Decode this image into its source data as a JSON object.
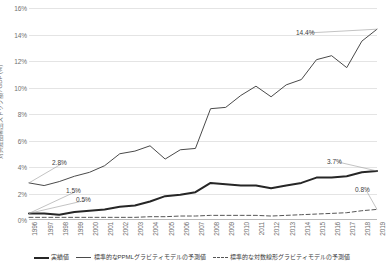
{
  "chart_data": {
    "type": "line",
    "title": "",
    "xlabel": "",
    "ylabel": "対共産圏輸出ストック額 / GDP (%)",
    "ylim": [
      0,
      16
    ],
    "ytick_labels": [
      "0%",
      "2%",
      "4%",
      "6%",
      "8%",
      "10%",
      "12%",
      "14%",
      "16%"
    ],
    "ytick_values": [
      0,
      2,
      4,
      6,
      8,
      10,
      12,
      14,
      16
    ],
    "grid": true,
    "legend_position": "bottom",
    "categories": [
      "1996",
      "1997",
      "1998",
      "1999",
      "2000",
      "2001",
      "2002",
      "2003",
      "2004",
      "2005",
      "2006",
      "2007",
      "2008",
      "2009",
      "2010",
      "2011",
      "2012",
      "2013",
      "2014",
      "2015",
      "2016",
      "2017",
      "2018",
      "2019"
    ],
    "series": [
      {
        "name": "実績値",
        "style": "solid-thick",
        "color": "#262626",
        "values": [
          0.5,
          0.5,
          0.4,
          0.6,
          0.7,
          0.8,
          1.0,
          1.1,
          1.4,
          1.8,
          1.9,
          2.1,
          2.8,
          2.7,
          2.6,
          2.6,
          2.4,
          2.6,
          2.8,
          3.2,
          3.2,
          3.3,
          3.6,
          3.7
        ]
      },
      {
        "name": "標準的なPPMLグラビティモデルの予測値",
        "style": "solid-thin",
        "color": "#4a4a4a",
        "values": [
          2.8,
          2.6,
          2.9,
          3.3,
          3.6,
          4.1,
          5.0,
          5.2,
          5.6,
          4.6,
          5.3,
          5.4,
          8.4,
          8.5,
          9.4,
          10.1,
          9.3,
          10.2,
          10.6,
          12.1,
          12.4,
          11.5,
          13.5,
          14.4
        ]
      },
      {
        "name": "標準的な対数線形グラビティモデルの予測値",
        "style": "dashed",
        "color": "#555555",
        "values": [
          0.2,
          0.2,
          0.2,
          0.2,
          0.2,
          0.2,
          0.2,
          0.2,
          0.25,
          0.25,
          0.3,
          0.3,
          0.35,
          0.35,
          0.35,
          0.35,
          0.3,
          0.35,
          0.4,
          0.45,
          0.5,
          0.55,
          0.7,
          0.8
        ]
      }
    ],
    "annotations": [
      {
        "label": "2.8%",
        "series": "標準的なPPMLグラビティモデルの予測値",
        "year": "1996",
        "value": 2.8
      },
      {
        "label": "1.5%",
        "series": "実績値",
        "year": "1996",
        "value": 0.5
      },
      {
        "label": "0.5%",
        "series": "実績値",
        "year": "1996",
        "value": 0.5
      },
      {
        "label": "14.4%",
        "series": "標準的なPPMLグラビティモデルの予測値",
        "year": "2019",
        "value": 14.4
      },
      {
        "label": "3.7%",
        "series": "実績値",
        "year": "2019",
        "value": 3.7
      },
      {
        "label": "0.8%",
        "series": "標準的な対数線形グラビティモデルの予測値",
        "year": "2019",
        "value": 0.8
      }
    ]
  }
}
